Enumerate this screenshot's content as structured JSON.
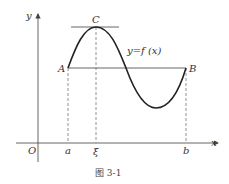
{
  "figure": {
    "caption": "图 3-1",
    "function_label": "y=f (x)",
    "axes": {
      "x_label": "x",
      "y_label": "y",
      "origin_label": "O"
    },
    "points": {
      "A": "A",
      "B": "B",
      "C": "C"
    },
    "x_ticks": {
      "a": "a",
      "xi": "ξ",
      "b": "b"
    },
    "colors": {
      "curve": "#222222",
      "lines": "#555555",
      "dashed": "#777777"
    }
  }
}
